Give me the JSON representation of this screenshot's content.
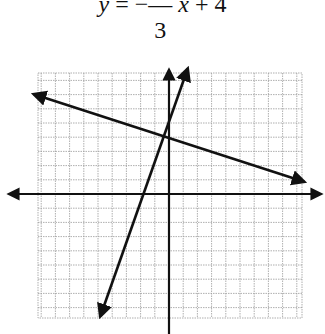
{
  "equation": {
    "lhs": "y",
    "equals": "=",
    "sign": "−",
    "numerator": "1",
    "denominator": "3",
    "variable": "x",
    "constant": "+ 4",
    "full_text": "y = −1/3 x + 4"
  },
  "graph": {
    "origin_px": [
      169,
      194
    ],
    "unit_px": 14.2,
    "grid_rect_px": [
      38,
      73,
      302,
      318
    ],
    "x_range": [
      -9,
      9
    ],
    "y_range": [
      -8.5,
      8.5
    ],
    "axis_color": "#111111",
    "grid_color": "#9a9a9a",
    "line_color": "#111111"
  },
  "lines": [
    {
      "name": "line-a",
      "equation": "y = -1/3 x + 4",
      "slope": -0.3333,
      "intercept": 4,
      "from_px": [
        30,
        93
      ],
      "to_px": [
        308,
        183
      ]
    },
    {
      "name": "line-b",
      "equation": "y = 3x + 5 (approx.)",
      "slope": 3,
      "intercept": 5,
      "from_px": [
        99,
        320
      ],
      "to_px": [
        189,
        65
      ]
    }
  ],
  "axes": {
    "x_axis": {
      "from_px": [
        5,
        194
      ],
      "to_px": [
        325,
        194
      ],
      "arrows": "both"
    },
    "y_axis": {
      "from_px": [
        169,
        334
      ],
      "to_px": [
        169,
        66
      ],
      "arrows": "up"
    }
  }
}
